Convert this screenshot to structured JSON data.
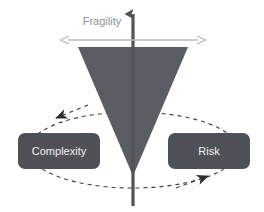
{
  "diagram": {
    "type": "fragility-risk-complexity-triangle",
    "background_color": "#ffffff",
    "axis": {
      "vertical_arrow": {
        "name": "fragility-axis-arrow",
        "color": "#56524f",
        "direction": "up"
      },
      "horizontal_arrow": {
        "name": "fragility-span-arrow",
        "label": "Fragility",
        "label_color": "#8e9296",
        "color": "#b5bcc2",
        "direction": "both"
      }
    },
    "wedge": {
      "name": "inverted-triangle",
      "color": "#5a5d63",
      "orientation": "inverted"
    },
    "nodes": [
      {
        "id": "complexity",
        "label": "Complexity",
        "fill": "#4e5157",
        "text_color": "#f2f2f2",
        "side": "left"
      },
      {
        "id": "risk",
        "label": "Risk",
        "fill": "#4e5157",
        "text_color": "#f2f2f2",
        "side": "right"
      }
    ],
    "cycle": {
      "name": "feedback-loop",
      "style": "dashed",
      "color": "#3d3d3d",
      "arrowheads": [
        {
          "id": "loop-arrow-left",
          "points_to": "complexity"
        },
        {
          "id": "loop-arrow-right",
          "points_to": "risk"
        }
      ]
    }
  }
}
